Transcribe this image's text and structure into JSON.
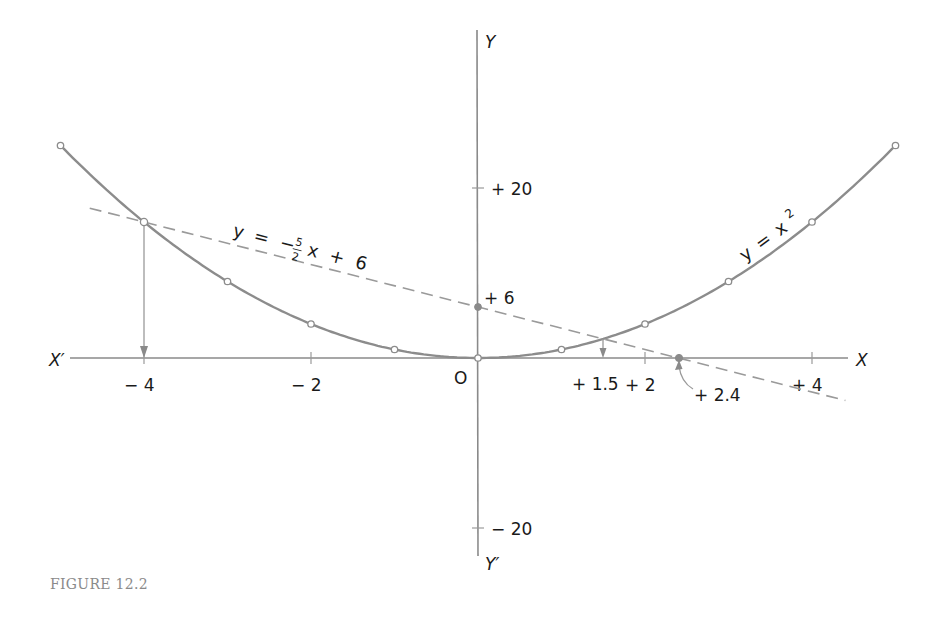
{
  "caption": "FIGURE 12.2",
  "chart_data": {
    "type": "line",
    "title": "",
    "xlabel": "X",
    "xlabel_negative": "X′",
    "ylabel": "Y",
    "ylabel_negative": "Y′",
    "origin_label": "O",
    "xlim": [
      -5,
      5
    ],
    "ylim": [
      -24,
      28
    ],
    "grid": false,
    "x_ticks": [
      {
        "value": -4,
        "label": "− 4"
      },
      {
        "value": -2,
        "label": "− 2"
      },
      {
        "value": 2,
        "label": "+ 2"
      },
      {
        "value": 4,
        "label": "+ 4"
      }
    ],
    "y_ticks": [
      {
        "value": 20,
        "label": "+ 20"
      },
      {
        "value": -20,
        "label": "− 20"
      }
    ],
    "series": [
      {
        "name": "y = x²",
        "style": "solid",
        "x": [
          -5,
          -4,
          -3,
          -2,
          -1,
          0,
          1,
          2,
          3,
          4,
          5
        ],
        "y": [
          25,
          16,
          9,
          4,
          1,
          0,
          1,
          4,
          9,
          16,
          25
        ]
      },
      {
        "name": "y = −(5/2)x + 6",
        "style": "dashed",
        "x": [
          -4.65,
          4.4
        ],
        "y": [
          17.625,
          -5
        ]
      }
    ],
    "annotations": [
      {
        "text": "+ 6",
        "x": 0,
        "y": 6,
        "note": "y-intercept of line"
      },
      {
        "text": "+ 1.5",
        "x": 1.5,
        "y": 0,
        "note": "intersection x (arrow down from curve)"
      },
      {
        "text": "+ 2.4",
        "x": 2.4,
        "y": 0,
        "note": "x-intercept of line"
      },
      {
        "text": "− 4",
        "x": -4,
        "y": 16,
        "note": "intersection x (arrow down from curve)"
      }
    ],
    "intersections": [
      {
        "x": -4,
        "y": 16
      },
      {
        "x": 1.5,
        "y": 2.25
      }
    ]
  },
  "labels": {
    "parabola": {
      "y": "y",
      "eq": "=",
      "x": "x",
      "exp": "2"
    },
    "line": {
      "y": "y",
      "eq": "=",
      "minus": "−",
      "num": "5",
      "den": "2",
      "x": "x",
      "plus": "+",
      "c": "6"
    },
    "y_intercept": "+ 6",
    "intersect_right": "+ 1.5",
    "x_intercept": "+ 2.4"
  }
}
